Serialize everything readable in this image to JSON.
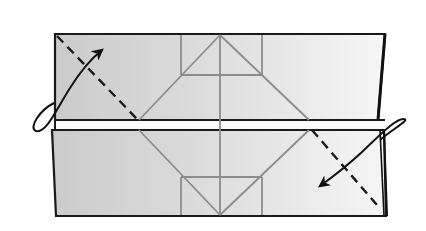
{
  "diagram": {
    "type": "origami-fold-step",
    "colors": {
      "background": "#ffffff",
      "paper_dark": "#cfcfcf",
      "paper_light": "#f4f4f4",
      "outline": "#1a1a1a",
      "crease": "#8c8c8c",
      "fold_line": "#1a1a1a"
    },
    "elements": {
      "top_layer": "paper layer (top)",
      "bottom_layer": "paper layer (bottom)",
      "crease_pattern": "diamond crease with center line and triangles",
      "valley_fold": "dashed diagonal valley fold line",
      "arrow_left": "curved fold arrow (top-left, pointing up-right)",
      "arrow_right": "curved fold arrow (bottom-right, pointing down-left)"
    }
  }
}
